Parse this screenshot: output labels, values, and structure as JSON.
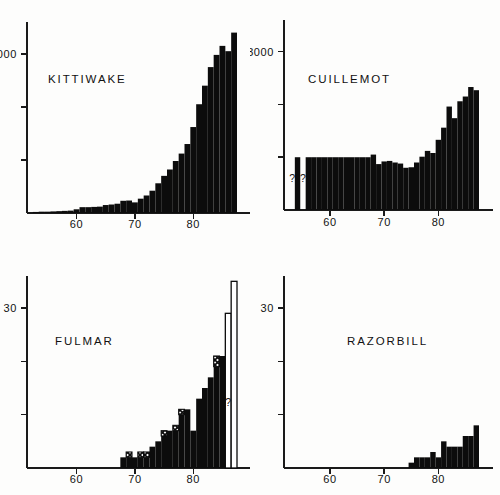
{
  "figure": {
    "background_color": "#fdfdfc",
    "ink_color": "#0c0c0c",
    "panel_count": 4
  },
  "panels": [
    {
      "id": "kittiwake",
      "title": "KITTIWAKE",
      "position": "top-left"
    },
    {
      "id": "guillemot",
      "title": "CUILLEMOT",
      "position": "top-right"
    },
    {
      "id": "fulmar",
      "title": "FULMAR",
      "position": "bottom-left"
    },
    {
      "id": "razorbill",
      "title": "RAZORBILL",
      "position": "bottom-right"
    }
  ],
  "annotations": {
    "guillemot_q1": "?",
    "guillemot_q2": "?",
    "fulmar_q1": "?"
  },
  "chart_data": [
    {
      "type": "bar",
      "id": "kittiwake",
      "title": "KITTIWAKE",
      "xlabel": "",
      "ylabel": "",
      "xlim": [
        52,
        88
      ],
      "ylim": [
        0,
        3600
      ],
      "xticks": [
        60,
        70,
        80
      ],
      "xtick_labels": [
        "60",
        "70",
        "80"
      ],
      "yticks": [
        1000,
        2000,
        3000
      ],
      "ytick_labels": [
        "",
        "",
        "3000"
      ],
      "grid": false,
      "legend": "none",
      "bar_style": "solid",
      "categories": [
        53,
        54,
        55,
        56,
        57,
        58,
        59,
        60,
        61,
        62,
        63,
        64,
        65,
        66,
        67,
        68,
        69,
        70,
        71,
        72,
        73,
        74,
        75,
        76,
        77,
        78,
        79,
        80,
        81,
        82,
        83,
        84,
        85,
        86,
        87
      ],
      "values": [
        20,
        25,
        25,
        30,
        35,
        40,
        45,
        70,
        110,
        110,
        115,
        120,
        150,
        160,
        175,
        230,
        235,
        200,
        270,
        330,
        420,
        560,
        700,
        820,
        980,
        1120,
        1300,
        1620,
        2050,
        2400,
        2750,
        2980,
        3150,
        3050,
        3400
      ]
    },
    {
      "type": "bar",
      "id": "guillemot",
      "title": "CUILLEMOT",
      "xlabel": "",
      "ylabel": "",
      "xlim": [
        52,
        88
      ],
      "ylim": [
        0,
        3600
      ],
      "xticks": [
        60,
        70,
        80
      ],
      "xtick_labels": [
        "60",
        "70",
        "80"
      ],
      "yticks": [
        1000,
        2000,
        3000
      ],
      "ytick_labels": [
        "",
        "",
        "3000"
      ],
      "grid": false,
      "legend": "none",
      "bar_style": "solid",
      "note": "two isolated early bars marked with question marks; gaps indicate missing data",
      "categories": [
        53,
        54,
        55,
        56,
        57,
        58,
        59,
        60,
        61,
        62,
        63,
        64,
        65,
        66,
        67,
        68,
        69,
        70,
        71,
        72,
        73,
        74,
        75,
        76,
        77,
        78,
        79,
        80,
        81,
        82,
        83,
        84,
        85,
        86,
        87
      ],
      "values": [
        0,
        1000,
        0,
        1000,
        1000,
        1000,
        1000,
        1000,
        1000,
        1000,
        1000,
        1000,
        1000,
        1000,
        1000,
        1050,
        870,
        920,
        930,
        900,
        880,
        800,
        810,
        900,
        1010,
        1120,
        1080,
        1330,
        1560,
        1960,
        1740,
        2060,
        2150,
        2330,
        2270
      ],
      "missing_bins": [
        53,
        55
      ],
      "question_marks": [
        {
          "x": 53,
          "label": "?"
        },
        {
          "x": 55,
          "label": "?"
        }
      ]
    },
    {
      "type": "bar",
      "id": "fulmar",
      "title": "FULMAR",
      "xlabel": "",
      "ylabel": "",
      "xlim": [
        52,
        88
      ],
      "ylim": [
        0,
        36
      ],
      "xticks": [
        60,
        70,
        80
      ],
      "xtick_labels": [
        "60",
        "70",
        "80"
      ],
      "yticks": [
        10,
        20,
        30
      ],
      "ytick_labels": [
        "",
        "",
        "30"
      ],
      "grid": false,
      "legend": "none",
      "bar_style": "mixed",
      "note": "solid bars with hatched uncertain tops; final two bars drawn as open outlines marked with a question mark",
      "categories": [
        53,
        54,
        55,
        56,
        57,
        58,
        59,
        60,
        61,
        62,
        63,
        64,
        65,
        66,
        67,
        68,
        69,
        70,
        71,
        72,
        73,
        74,
        75,
        76,
        77,
        78,
        79,
        80,
        81,
        82,
        83,
        84,
        85,
        86,
        87
      ],
      "values": [
        0,
        0,
        0,
        0,
        0,
        0,
        0,
        0,
        0,
        0,
        0,
        0,
        0,
        0,
        0,
        2,
        3,
        2,
        2,
        2,
        4,
        5,
        7,
        7,
        7,
        11,
        11,
        7,
        13,
        15,
        17,
        21,
        21,
        29,
        35
      ],
      "series": [
        {
          "name": "solid",
          "values": [
            0,
            0,
            0,
            0,
            0,
            0,
            0,
            0,
            0,
            0,
            0,
            0,
            0,
            0,
            0,
            2,
            2,
            2,
            2,
            2,
            4,
            5,
            6,
            7,
            7,
            10,
            11,
            7,
            13,
            15,
            17,
            19,
            21,
            0,
            0
          ]
        },
        {
          "name": "hatched",
          "values": [
            0,
            0,
            0,
            0,
            0,
            0,
            0,
            0,
            0,
            0,
            0,
            0,
            0,
            0,
            0,
            0,
            1,
            0,
            1,
            1,
            0,
            0,
            1,
            0,
            1,
            1,
            0,
            0,
            0,
            0,
            0,
            2,
            0,
            0,
            0
          ]
        },
        {
          "name": "open",
          "values": [
            0,
            0,
            0,
            0,
            0,
            0,
            0,
            0,
            0,
            0,
            0,
            0,
            0,
            0,
            0,
            0,
            0,
            0,
            0,
            0,
            0,
            0,
            0,
            0,
            0,
            0,
            0,
            0,
            0,
            0,
            0,
            0,
            0,
            29,
            35
          ]
        }
      ],
      "question_marks": [
        {
          "x": 86,
          "label": "?"
        }
      ]
    },
    {
      "type": "bar",
      "id": "razorbill",
      "title": "RAZORBILL",
      "xlabel": "",
      "ylabel": "",
      "xlim": [
        52,
        88
      ],
      "ylim": [
        0,
        36
      ],
      "xticks": [
        60,
        70,
        80
      ],
      "xtick_labels": [
        "60",
        "70",
        "80"
      ],
      "yticks": [
        10,
        20,
        30
      ],
      "ytick_labels": [
        "",
        "",
        "30"
      ],
      "grid": false,
      "legend": "none",
      "bar_style": "solid",
      "categories": [
        53,
        54,
        55,
        56,
        57,
        58,
        59,
        60,
        61,
        62,
        63,
        64,
        65,
        66,
        67,
        68,
        69,
        70,
        71,
        72,
        73,
        74,
        75,
        76,
        77,
        78,
        79,
        80,
        81,
        82,
        83,
        84,
        85,
        86,
        87
      ],
      "values": [
        0,
        0,
        0,
        0,
        0,
        0,
        0,
        0,
        0,
        0,
        0,
        0,
        0,
        0,
        0,
        0,
        0,
        0,
        0,
        0,
        0,
        0,
        1,
        2,
        2,
        2,
        3,
        2,
        5,
        4,
        4,
        4,
        6,
        6,
        8
      ]
    }
  ]
}
